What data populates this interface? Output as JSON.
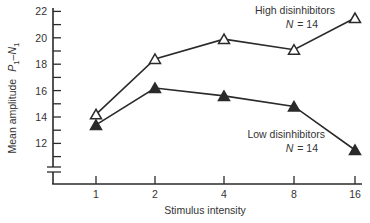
{
  "chart_data": {
    "type": "line",
    "title": "",
    "xlabel": "Stimulus intensity",
    "ylabel": "Mean amplitude P1–N1",
    "ylabel_parts": {
      "main": "Mean amplitude",
      "p": "P",
      "p_sub": "1",
      "dash": "–",
      "n": "N",
      "n_sub": "1"
    },
    "categories": [
      "1",
      "2",
      "4",
      "8",
      "16"
    ],
    "yticks": [
      12,
      14,
      16,
      18,
      20,
      22
    ],
    "ylim": [
      10,
      22
    ],
    "axis_break": true,
    "grid": false,
    "series": [
      {
        "name": "High disinhibitors",
        "n_label": "N",
        "n_value": "= 14",
        "marker": "open-triangle",
        "values": [
          14.2,
          18.4,
          19.9,
          19.1,
          21.5
        ]
      },
      {
        "name": "Low disinhibitors",
        "n_label": "N",
        "n_value": "= 14",
        "marker": "filled-triangle",
        "values": [
          13.4,
          16.2,
          15.6,
          14.8,
          11.5
        ]
      }
    ]
  }
}
